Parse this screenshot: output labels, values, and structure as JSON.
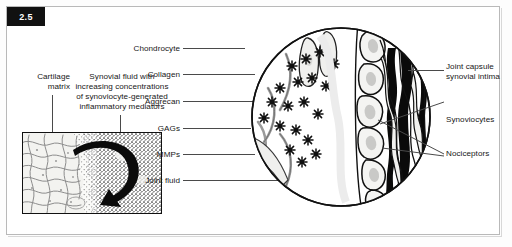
{
  "figure": {
    "number": "2.5",
    "domain": "medical-illustration"
  },
  "left_panel": {
    "cartilage_label": {
      "line1": "Cartilage",
      "line2": "matrix"
    },
    "synovial_caption": {
      "line1": "Synovial fluid with",
      "line2": "increasing concentrations",
      "line3": "of synoviocyte-generated",
      "line4": "inflammatory mediators"
    },
    "inset_name": "cartilage-matrix-inset"
  },
  "center_labels": [
    {
      "id": "chondrocyte",
      "text": "Chondrocyte"
    },
    {
      "id": "collagen",
      "text": "Collagen"
    },
    {
      "id": "aggrecan",
      "text": "Aggrecan"
    },
    {
      "id": "gags",
      "text": "GAGs"
    },
    {
      "id": "mmps",
      "text": "MMPs"
    },
    {
      "id": "joint-fluid",
      "text": "Joint fluid"
    }
  ],
  "right_labels": [
    {
      "id": "joint-capsule",
      "line1": "Joint capsule",
      "line2": "synovial intima"
    },
    {
      "id": "synoviocytes",
      "line1": "Synoviocytes",
      "line2": ""
    },
    {
      "id": "nociceptors",
      "line1": "Nociceptors",
      "line2": ""
    }
  ],
  "colors": {
    "ink": "#111111",
    "leader": "#4a4a4a",
    "frame": "#b9b9b9",
    "badge_bg": "#111111",
    "badge_fg": "#ffffff",
    "matrix_fiber": "#8d8d8d",
    "matrix_fill": "#f1f1ee"
  }
}
